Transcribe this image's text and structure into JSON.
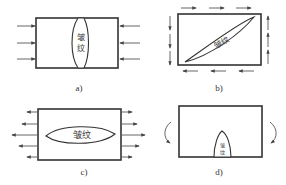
{
  "figure": {
    "panels": [
      {
        "id": "a",
        "label": "a)",
        "crack_text": "皱纹",
        "crack_text_lines": [
          "皱",
          "纹"
        ],
        "loading": "compression-horizontal"
      },
      {
        "id": "b",
        "label": "b)",
        "crack_text": "皱纹",
        "loading": "shear"
      },
      {
        "id": "c",
        "label": "c)",
        "crack_text": "皱纹",
        "loading": "tension-horizontal"
      },
      {
        "id": "d",
        "label": "d)",
        "crack_text": "皱纹",
        "crack_text_lines": [
          "皱",
          "纹"
        ],
        "loading": "bending"
      }
    ],
    "colors": {
      "line": "#333333",
      "arrow": "#555555",
      "background": "#ffffff"
    }
  }
}
